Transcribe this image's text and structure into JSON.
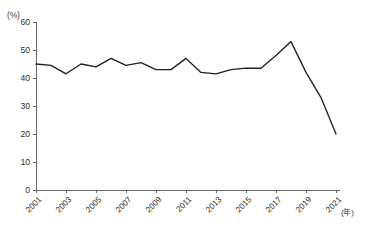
{
  "chart_data": {
    "type": "line",
    "title": "",
    "xlabel": "(年)",
    "ylabel": "(%)",
    "ylim": [
      0,
      60
    ],
    "xlim": [
      2001,
      2021
    ],
    "yticks": [
      0,
      10,
      20,
      30,
      40,
      50,
      60
    ],
    "ytick_labels": [
      "0",
      "10",
      "20",
      "30",
      "40",
      "50",
      "60"
    ],
    "xticks": [
      2001,
      2003,
      2005,
      2007,
      2009,
      2011,
      2013,
      2015,
      2017,
      2019,
      2021
    ],
    "xtick_labels": [
      "2001",
      "2003",
      "2005",
      "2007",
      "2009",
      "2011",
      "2013",
      "2015",
      "2017",
      "2019",
      "2021"
    ],
    "grid": false,
    "legend": null,
    "line_color": "#231f20",
    "x": [
      2001,
      2002,
      2003,
      2004,
      2005,
      2006,
      2007,
      2008,
      2009,
      2010,
      2011,
      2012,
      2013,
      2014,
      2015,
      2016,
      2017,
      2018,
      2019,
      2020,
      2021
    ],
    "values": [
      45.0,
      44.5,
      41.5,
      45.0,
      44.0,
      47.0,
      44.5,
      45.5,
      43.0,
      43.0,
      47.0,
      42.0,
      41.5,
      43.0,
      43.5,
      43.5,
      48.0,
      53.0,
      42.0,
      33.0,
      20.0
    ],
    "series": [
      {
        "name": "",
        "values": [
          45.0,
          44.5,
          41.5,
          45.0,
          44.0,
          47.0,
          44.5,
          45.5,
          43.0,
          43.0,
          47.0,
          42.0,
          41.5,
          43.0,
          43.5,
          43.5,
          48.0,
          53.0,
          42.0,
          33.0,
          20.0
        ]
      }
    ]
  },
  "axes": {
    "y_unit": "(%)",
    "x_unit": "(年)"
  }
}
